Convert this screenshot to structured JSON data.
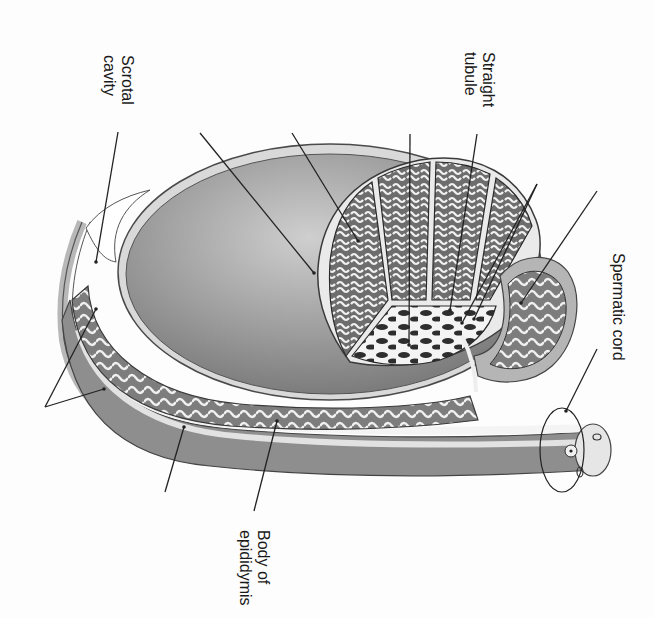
{
  "diagram": {
    "orientation_deg": 90,
    "colors": {
      "background": "#fdfdfd",
      "tunica_fill": "#9a9a9a",
      "tunica_highlight": "#d6d6d6",
      "lobule_fill": "#6e6e6e",
      "tubule_fill": "#f2f2f2",
      "outline": "#3a3a3a",
      "leader": "#222222",
      "text": "#1a1a1a"
    },
    "labels": [
      {
        "id": "scrotal-cavity",
        "lines": [
          "Scrotal",
          "cavity"
        ],
        "x": 136,
        "y": 55
      },
      {
        "id": "straight-tubule",
        "lines": [
          "Straight",
          "tubule"
        ],
        "x": 497,
        "y": 52
      },
      {
        "id": "spermatic-cord",
        "lines": [
          "Spermatic cord"
        ],
        "x": 627,
        "y": 253
      },
      {
        "id": "body-of-epididymis",
        "lines": [
          "Body of",
          "epididymis"
        ],
        "x": 272,
        "y": 530
      }
    ],
    "leaders": [
      {
        "id": "scrotal-cavity-leader",
        "x1": 118,
        "y1": 132,
        "x2": 96,
        "y2": 262
      },
      {
        "id": "tunica-albuginea-leader",
        "x1": 200,
        "y1": 133,
        "x2": 314,
        "y2": 273
      },
      {
        "id": "seminiferous-tubule-leader",
        "x1": 292,
        "y1": 133,
        "x2": 358,
        "y2": 241
      },
      {
        "id": "septum-leader",
        "x1": 410,
        "y1": 134,
        "x2": 409,
        "y2": 345
      },
      {
        "id": "straight-tubule-leader",
        "x1": 477,
        "y1": 134,
        "x2": 450,
        "y2": 310
      },
      {
        "id": "rete-testis-leader-a",
        "x1": 537,
        "y1": 184,
        "x2": 462,
        "y2": 323
      },
      {
        "id": "rete-testis-leader-b",
        "x1": 537,
        "y1": 184,
        "x2": 474,
        "y2": 319
      },
      {
        "id": "head-of-epididymis-leader",
        "x1": 597,
        "y1": 191,
        "x2": 521,
        "y2": 303
      },
      {
        "id": "spermatic-cord-leader",
        "x1": 597,
        "y1": 349,
        "x2": 566,
        "y2": 411
      },
      {
        "id": "tail-of-epididymis-leader-a",
        "x1": 45,
        "y1": 407,
        "x2": 96,
        "y2": 309
      },
      {
        "id": "tail-of-epididymis-leader-b",
        "x1": 45,
        "y1": 407,
        "x2": 104,
        "y2": 389
      },
      {
        "id": "ductus-deferens-leader",
        "x1": 165,
        "y1": 492,
        "x2": 184,
        "y2": 427
      },
      {
        "id": "body-of-epididymis-leader",
        "x1": 254,
        "y1": 511,
        "x2": 277,
        "y2": 421
      }
    ]
  }
}
